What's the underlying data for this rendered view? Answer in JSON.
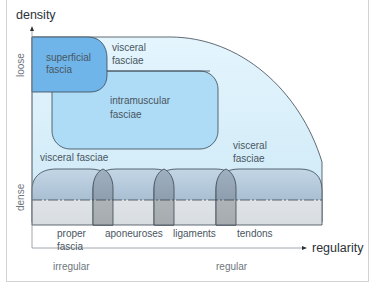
{
  "diagram": {
    "type": "fascia-classification",
    "axes": {
      "y": {
        "title": "density",
        "low": "dense",
        "high": "loose"
      },
      "x": {
        "title": "regularity",
        "low": "irregular",
        "high": "regular"
      }
    },
    "regions": {
      "superficial_fascia": [
        "superficial",
        "fascia"
      ],
      "visceral_fasciae_top": [
        "visceral",
        "fasciae"
      ],
      "intramuscular_fasciae": [
        "intramuscular",
        "fasciae"
      ],
      "visceral_fasciae_left": "visceral fasciae",
      "visceral_fasciae_right": [
        "visceral",
        "fasciae"
      ]
    },
    "dense_categories": [
      {
        "line1": "proper",
        "line2": "fascia"
      },
      {
        "line1": "aponeuroses",
        "line2": ""
      },
      {
        "line1": "ligaments",
        "line2": ""
      },
      {
        "line1": "tendons",
        "line2": ""
      }
    ],
    "colors": {
      "loose_area": "#d9f0fb",
      "intramuscular": "#aedcf6",
      "superficial": "#6fb5ea",
      "dense_band_top": "#b9cfe0",
      "dense_band_bottom": "#dde2e6",
      "overlap": "#9aa6b0",
      "outline": "#3b4650"
    }
  }
}
